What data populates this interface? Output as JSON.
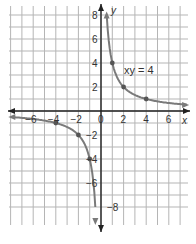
{
  "chart_data": {
    "type": "line",
    "title": "",
    "equation_label": "xy = 4",
    "xlabel": "x",
    "ylabel": "y",
    "xlim": [
      -8,
      7.5
    ],
    "ylim": [
      -8.5,
      8.5
    ],
    "grid": true,
    "x_ticks": [
      -6,
      -4,
      -2,
      0,
      2,
      4,
      6
    ],
    "x_tick_labels": [
      "−6",
      "−4",
      "−2",
      "0",
      "2",
      "4",
      "6"
    ],
    "y_ticks": [
      8,
      6,
      4,
      2,
      -2,
      -4,
      -6,
      -8
    ],
    "y_tick_labels": [
      "8",
      "6",
      "4",
      "2",
      "−2",
      "−4",
      "−6",
      "−8"
    ],
    "series": [
      {
        "name": "xy = 4 (first quadrant branch)",
        "points": [
          [
            0.5,
            8
          ],
          [
            1,
            4
          ],
          [
            2,
            2
          ],
          [
            4,
            1
          ],
          [
            8,
            0.5
          ]
        ],
        "marked_points": [
          [
            1,
            4
          ],
          [
            2,
            2
          ],
          [
            4,
            1
          ]
        ]
      },
      {
        "name": "xy = 4 (third quadrant branch)",
        "points": [
          [
            -8,
            -0.5
          ],
          [
            -4,
            -1
          ],
          [
            -2,
            -2
          ],
          [
            -1,
            -4
          ],
          [
            -0.5,
            -8
          ]
        ],
        "marked_points": [
          [
            -4,
            -1
          ],
          [
            -2,
            -2
          ],
          [
            -1,
            -4
          ]
        ]
      }
    ],
    "colors": {
      "curve": "#7a7a7a",
      "axes": "#222222",
      "grid": "#b5b5b5"
    }
  }
}
